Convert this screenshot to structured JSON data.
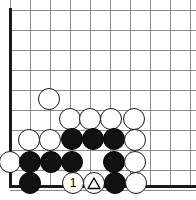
{
  "diagram": {
    "type": "go-board-problem",
    "board": {
      "origin_x": 10,
      "origin_y": 10,
      "spacing": 20,
      "cols": 10,
      "rows": 10,
      "left_edge": true,
      "bottom_edge": true,
      "line_color": "#8c8c8c",
      "edge_color": "#1a1a1a",
      "background": "#ffffff"
    },
    "stone_radius": 11,
    "colors": {
      "black_stone": "#111111",
      "white_stone": "#ffffff",
      "stone_outline": "#1a1a1a",
      "mark": "#000000"
    },
    "stones": [
      {
        "id": "w-a",
        "color": "white",
        "cx": 49,
        "cy": 99,
        "mark": "none",
        "label": ""
      },
      {
        "id": "w-b",
        "color": "white",
        "cx": 70,
        "cy": 119,
        "mark": "none",
        "label": ""
      },
      {
        "id": "w-c",
        "color": "white",
        "cx": 90,
        "cy": 119,
        "mark": "none",
        "label": ""
      },
      {
        "id": "w-d",
        "color": "white",
        "cx": 111,
        "cy": 119,
        "mark": "none",
        "label": ""
      },
      {
        "id": "w-e",
        "color": "white",
        "cx": 134,
        "cy": 119,
        "mark": "none",
        "label": ""
      },
      {
        "id": "w-f",
        "color": "white",
        "cx": 29,
        "cy": 140,
        "mark": "none",
        "label": ""
      },
      {
        "id": "w-g",
        "color": "white",
        "cx": 50,
        "cy": 140,
        "mark": "none",
        "label": ""
      },
      {
        "id": "b-a",
        "color": "black",
        "cx": 72,
        "cy": 139,
        "mark": "none",
        "label": ""
      },
      {
        "id": "b-b",
        "color": "black",
        "cx": 93,
        "cy": 139,
        "mark": "none",
        "label": ""
      },
      {
        "id": "b-c",
        "color": "black",
        "cx": 114,
        "cy": 139,
        "mark": "none",
        "label": ""
      },
      {
        "id": "w-h",
        "color": "white",
        "cx": 135,
        "cy": 140,
        "mark": "none",
        "label": ""
      },
      {
        "id": "w-i",
        "color": "white",
        "cx": 10,
        "cy": 162,
        "mark": "none",
        "label": ""
      },
      {
        "id": "b-d",
        "color": "black",
        "cx": 30,
        "cy": 162,
        "mark": "none",
        "label": ""
      },
      {
        "id": "b-e",
        "color": "black",
        "cx": 51,
        "cy": 162,
        "mark": "none",
        "label": ""
      },
      {
        "id": "b-f",
        "color": "black",
        "cx": 72,
        "cy": 162,
        "mark": "none",
        "label": ""
      },
      {
        "id": "b-g",
        "color": "black",
        "cx": 114,
        "cy": 162,
        "mark": "none",
        "label": ""
      },
      {
        "id": "w-j",
        "color": "white",
        "cx": 135,
        "cy": 162,
        "mark": "none",
        "label": ""
      },
      {
        "id": "b-h",
        "color": "black",
        "cx": 30,
        "cy": 183,
        "mark": "none",
        "label": ""
      },
      {
        "id": "w-move1",
        "color": "white",
        "cx": 73,
        "cy": 183,
        "mark": "number",
        "label": "1"
      },
      {
        "id": "w-tri",
        "color": "white",
        "cx": 94,
        "cy": 183,
        "mark": "triangle",
        "label": ""
      },
      {
        "id": "b-i",
        "color": "black",
        "cx": 115,
        "cy": 183,
        "mark": "none",
        "label": ""
      },
      {
        "id": "w-k",
        "color": "white",
        "cx": 136,
        "cy": 183,
        "mark": "none",
        "label": ""
      }
    ]
  }
}
